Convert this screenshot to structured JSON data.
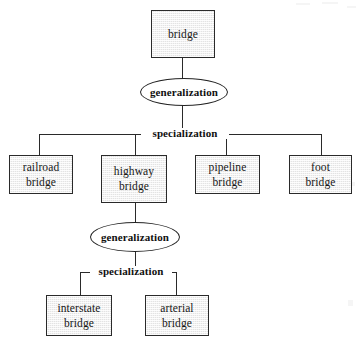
{
  "diagram": {
    "type": "entity-relationship-generalization-diagram",
    "colors": {
      "entity_fill": "#e3e3e3",
      "stroke": "#2a2a2a",
      "text": "#101010",
      "background": "#ffffff"
    },
    "entities": [
      {
        "id": "bridge",
        "label": "bridge",
        "line1": "bridge",
        "line2": "",
        "x": 151,
        "y": 10,
        "w": 64,
        "h": 48
      },
      {
        "id": "railroad-bridge",
        "label": "railroad bridge",
        "line1": "railroad",
        "line2": "bridge",
        "x": 9,
        "y": 155,
        "w": 64,
        "h": 39
      },
      {
        "id": "highway-bridge",
        "label": "highway bridge",
        "line1": "highway",
        "line2": "bridge",
        "x": 101,
        "y": 155,
        "w": 66,
        "h": 48
      },
      {
        "id": "pipeline-bridge",
        "label": "pipeline bridge",
        "line1": "pipeline",
        "line2": "bridge",
        "x": 195,
        "y": 155,
        "w": 65,
        "h": 39
      },
      {
        "id": "foot-bridge",
        "label": "foot bridge",
        "line1": "foot",
        "line2": "bridge",
        "x": 289,
        "y": 155,
        "w": 63,
        "h": 39
      },
      {
        "id": "interstate-bridge",
        "label": "interstate bridge",
        "line1": "interstate",
        "line2": "bridge",
        "x": 46,
        "y": 295,
        "w": 66,
        "h": 41
      },
      {
        "id": "arterial-bridge",
        "label": "arterial bridge",
        "line1": "arterial",
        "line2": "bridge",
        "x": 145,
        "y": 295,
        "w": 64,
        "h": 41
      }
    ],
    "relationships": [
      {
        "id": "generalization-top",
        "label": "generalization",
        "x": 140,
        "y": 78,
        "w": 88,
        "h": 28
      },
      {
        "id": "generalization-bottom",
        "label": "generalization",
        "x": 90,
        "y": 222,
        "w": 90,
        "h": 30
      }
    ],
    "bar_labels": [
      {
        "id": "specialization-top",
        "label": "specialization",
        "x": 141,
        "y": 128
      },
      {
        "id": "specialization-bottom",
        "label": "specialization",
        "x": 90,
        "y": 266
      }
    ]
  }
}
